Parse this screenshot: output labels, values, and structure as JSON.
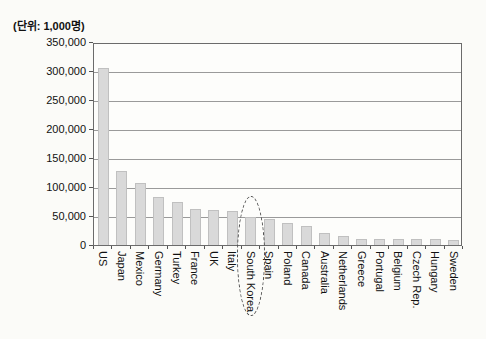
{
  "chart_data": {
    "type": "bar",
    "title": "",
    "unit": "(단위: 1,000명)",
    "categories": [
      "US",
      "Japan",
      "Mexico",
      "Germany",
      "Turkey",
      "France",
      "UK",
      "Italy",
      "South Korea",
      "Spain",
      "Poland",
      "Canada",
      "Australia",
      "Netherlands",
      "Greece",
      "Portugal",
      "Belgium",
      "Czech Rep.",
      "Hungary",
      "Sweden"
    ],
    "values": [
      305000,
      128000,
      107000,
      83000,
      74000,
      62000,
      61000,
      59000,
      48000,
      44000,
      38000,
      33000,
      21000,
      16000,
      11000,
      10600,
      10500,
      10300,
      10000,
      9000
    ],
    "xlabel": "",
    "ylabel": "",
    "ylim": [
      0,
      350000
    ],
    "ytick_interval": 50000,
    "ytick_labels": [
      "350,000",
      "300,000",
      "250,000",
      "200,000",
      "150,000",
      "100,000",
      "50,000",
      "0"
    ],
    "grid": "horizontal",
    "legend": "none",
    "highlight": {
      "category": "South Korea",
      "style": "dashed-ellipse"
    }
  },
  "colors": {
    "bar_fill": "#d9d9d9",
    "bar_border": "#c0c0c0",
    "gridline": "#9a9a9a",
    "frame": "#6b6b6b",
    "text": "#111111",
    "background": "#fbfbf8",
    "highlight_outline": "#4a4a4a"
  }
}
